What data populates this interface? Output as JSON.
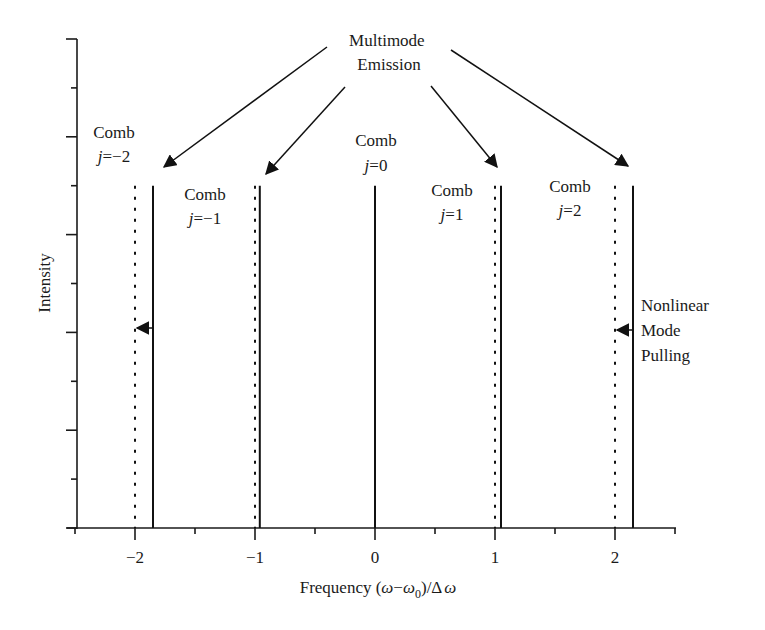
{
  "chart_data": {
    "type": "line",
    "title": "",
    "xlabel": "Frequency (ω−ω0)/Δω",
    "xlabel_parts": {
      "prefix": "Frequency (",
      "omega": "ω",
      "minus": "−",
      "omega0": "ω",
      "sub": "0",
      "rest": ")/Δ",
      "omega2": "ω"
    },
    "ylabel": "Intensity",
    "xlim": [
      -2.5,
      2.5
    ],
    "x_ticks": [
      -2,
      -1,
      0,
      1,
      2
    ],
    "x_tick_labels": [
      "−2",
      "−1",
      "0",
      "1",
      "2"
    ],
    "x_minor_ticks": [
      -2.5,
      -1.5,
      -0.5,
      0.5,
      1.5,
      2.5
    ],
    "ylim": [
      0,
      1
    ],
    "y_ticks": 10,
    "grid": false,
    "series": [
      {
        "name": "Unperturbed comb lines (dotted)",
        "style": "dotted",
        "x": [
          -2,
          -1,
          1,
          2
        ],
        "height": 0.7
      },
      {
        "name": "Pulled modes (solid)",
        "style": "solid",
        "x": [
          -1.85,
          -0.96,
          0,
          1.05,
          2.15
        ],
        "height": 0.7
      }
    ],
    "annotations": {
      "multimode": {
        "line1": "Multimode",
        "line2": "Emission"
      },
      "combs": [
        {
          "line1": "Comb",
          "j": "j",
          "eq": "=",
          "value": "−2"
        },
        {
          "line1": "Comb",
          "j": "j",
          "eq": "=",
          "value": "−1"
        },
        {
          "line1": "Comb",
          "j": "j",
          "eq": "=",
          "value": "0"
        },
        {
          "line1": "Comb",
          "j": "j",
          "eq": "=",
          "value": "1"
        },
        {
          "line1": "Comb",
          "j": "j",
          "eq": "=",
          "value": "2"
        }
      ],
      "pulling": {
        "line1": "Nonlinear",
        "line2": "Mode",
        "line3": "Pulling"
      }
    }
  }
}
